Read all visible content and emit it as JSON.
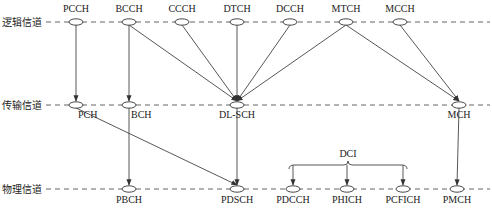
{
  "layers": [
    {
      "id": "logical",
      "label": "逻辑信道"
    },
    {
      "id": "transport",
      "label": "传输信道"
    },
    {
      "id": "physical",
      "label": "物理信道"
    }
  ],
  "nodes": {
    "logical": [
      "PCCH",
      "BCCH",
      "CCCH",
      "DTCH",
      "DCCH",
      "MTCH",
      "MCCH"
    ],
    "transport": [
      "PCH",
      "BCH",
      "DL-SCH",
      "MCH"
    ],
    "physical": [
      "PBCH",
      "PDSCH",
      "PDCCH",
      "PHICH",
      "PCFICH",
      "PMCH"
    ]
  },
  "edges": [
    [
      "PCCH",
      "PCH"
    ],
    [
      "BCCH",
      "BCH"
    ],
    [
      "BCCH",
      "DL-SCH"
    ],
    [
      "CCCH",
      "DL-SCH"
    ],
    [
      "DTCH",
      "DL-SCH"
    ],
    [
      "DCCH",
      "DL-SCH"
    ],
    [
      "MTCH",
      "DL-SCH"
    ],
    [
      "MTCH",
      "MCH"
    ],
    [
      "MCCH",
      "MCH"
    ],
    [
      "PCH",
      "PDSCH"
    ],
    [
      "BCH",
      "PBCH"
    ],
    [
      "DL-SCH",
      "PDSCH"
    ],
    [
      "MCH",
      "PMCH"
    ]
  ],
  "group": {
    "label": "DCI",
    "members": [
      "PDCCH",
      "PHICH",
      "PCFICH"
    ]
  }
}
